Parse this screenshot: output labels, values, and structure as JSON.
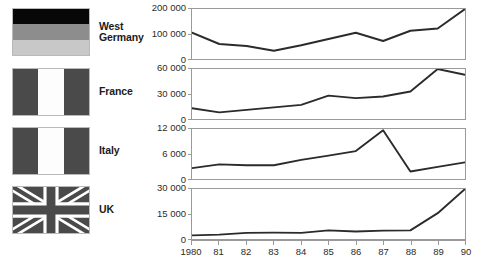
{
  "legend": {
    "rows": [
      {
        "flag": "flag-west-germany",
        "label": "West\nGermany"
      },
      {
        "flag": "flag-france",
        "label": "France"
      },
      {
        "flag": "flag-italy",
        "label": "Italy"
      },
      {
        "flag": "flag-uk",
        "label": "UK"
      }
    ]
  },
  "xaxis": {
    "ticks": [
      "1980",
      "81",
      "82",
      "83",
      "84",
      "85",
      "86",
      "87",
      "88",
      "89",
      "90"
    ]
  },
  "colors": {
    "line": "#2b2b2b",
    "axis": "#9a9a9a",
    "text": "#2b2b2b",
    "flag_dark": "#4a4a4a",
    "flag_black": "#070707",
    "flag_mid": "#8d8d8d",
    "flag_light": "#c8c8c8"
  },
  "chart_data": [
    {
      "type": "line",
      "title": "West Germany",
      "xlabel": "",
      "ylabel": "",
      "x": [
        1980,
        1981,
        1982,
        1983,
        1984,
        1985,
        1986,
        1987,
        1988,
        1989,
        1990
      ],
      "values": [
        105000,
        60000,
        52000,
        33000,
        55000,
        80000,
        105000,
        72000,
        113000,
        122000,
        200000
      ],
      "ylim": [
        0,
        200000
      ],
      "yticks": [
        0,
        100000,
        200000
      ],
      "ytick_labels": [
        "0",
        "100 000",
        "200 000"
      ],
      "grid": false,
      "legend": "none"
    },
    {
      "type": "line",
      "title": "France",
      "xlabel": "",
      "ylabel": "",
      "x": [
        1980,
        1981,
        1982,
        1983,
        1984,
        1985,
        1986,
        1987,
        1988,
        1989,
        1990
      ],
      "values": [
        13000,
        8000,
        11000,
        14000,
        17000,
        28000,
        25000,
        27000,
        33000,
        60000,
        53000
      ],
      "ylim": [
        0,
        60000
      ],
      "yticks": [
        0,
        30000,
        60000
      ],
      "ytick_labels": [
        "0",
        "30 000",
        "60 000"
      ],
      "grid": false,
      "legend": "none"
    },
    {
      "type": "line",
      "title": "Italy",
      "xlabel": "",
      "ylabel": "",
      "x": [
        1980,
        1981,
        1982,
        1983,
        1984,
        1985,
        1986,
        1987,
        1988,
        1989,
        1990
      ],
      "values": [
        2600,
        3500,
        3300,
        3300,
        4600,
        5600,
        6700,
        11700,
        1800,
        2900,
        4000
      ],
      "ylim": [
        0,
        12000
      ],
      "yticks": [
        0,
        6000,
        12000
      ],
      "ytick_labels": [
        "0",
        "6 000",
        "12 000"
      ],
      "grid": false,
      "legend": "none"
    },
    {
      "type": "line",
      "title": "UK",
      "xlabel": "",
      "ylabel": "",
      "x": [
        1980,
        1981,
        1982,
        1983,
        1984,
        1985,
        1986,
        1987,
        1988,
        1989,
        1990
      ],
      "values": [
        2200,
        2600,
        3700,
        3800,
        3700,
        5200,
        4500,
        5000,
        5200,
        15500,
        30000
      ],
      "ylim": [
        0,
        30000
      ],
      "yticks": [
        0,
        15000,
        30000
      ],
      "ytick_labels": [
        "0",
        "15 000",
        "30 000"
      ],
      "grid": false,
      "legend": "none"
    }
  ]
}
